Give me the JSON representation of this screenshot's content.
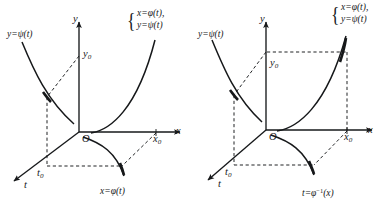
{
  "figure": {
    "background_color": "#ffffff",
    "ink_color": "#16181a",
    "panels": [
      {
        "id": "left",
        "name": "panel-left",
        "axes": {
          "y_label": "y",
          "x_label": "x",
          "t_label": "t",
          "origin_label": "O",
          "y0_label": "y",
          "y0_sub": "0",
          "x0_label": "x",
          "x0_sub": "0",
          "t0_label": "t",
          "t0_sub": "0"
        },
        "labels": {
          "psi_curve": "y=ψ(t)",
          "phi_curve": "x=φ(t)",
          "brace_line1": "x=φ(t),",
          "brace_line2": "y=ψ(t)"
        }
      },
      {
        "id": "right",
        "name": "panel-right",
        "axes": {
          "y_label": "y",
          "x_label": "x",
          "t_label": "t",
          "origin_label": "O",
          "y0_label": "y",
          "y0_sub": "0",
          "x0_label": "x",
          "x0_sub": "0",
          "t0_label": "t",
          "t0_sub": "0"
        },
        "labels": {
          "psi_curve": "y=ψ(t)",
          "inverse_curve_base": "t=φ",
          "inverse_curve_sup": "−1",
          "inverse_curve_arg": "(x)",
          "brace_line1": "x=φ(t),",
          "brace_line2": "y=ψ(t)"
        }
      }
    ]
  }
}
